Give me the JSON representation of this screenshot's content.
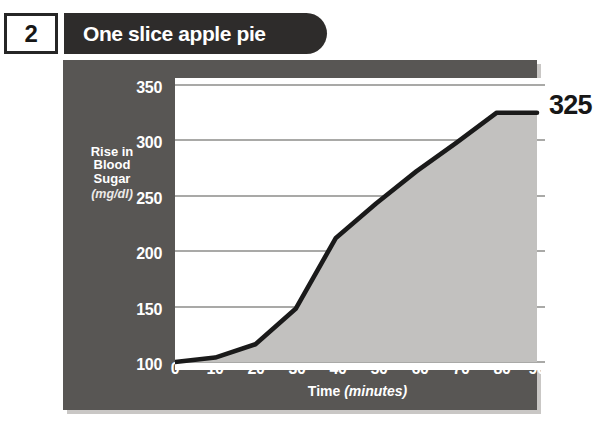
{
  "figure": {
    "number": "2",
    "title": "One slice apple pie",
    "callout_value": "325"
  },
  "chart_data": {
    "type": "area",
    "title": "One slice apple pie",
    "xlabel": "Time",
    "xlabel_unit": "(minutes)",
    "ylabel_lines": [
      "Rise in",
      "Blood",
      "Sugar"
    ],
    "ylabel_unit": "(mg/dl)",
    "x": [
      0,
      10,
      20,
      30,
      40,
      50,
      60,
      70,
      80,
      90
    ],
    "values": [
      100,
      104,
      116,
      148,
      212,
      243,
      272,
      298,
      325,
      325
    ],
    "xticks": [
      "0",
      "10",
      "20",
      "30",
      "40",
      "50",
      "60",
      "70",
      "80",
      "90"
    ],
    "yticks": [
      "100",
      "150",
      "200",
      "250",
      "300",
      "350"
    ],
    "ytick_values": [
      100,
      150,
      200,
      250,
      300,
      350
    ],
    "xlim": [
      0,
      90
    ],
    "ylim": [
      100,
      360
    ],
    "grid": true,
    "legend": "none",
    "annotations": [
      {
        "text": "325",
        "x": 90,
        "y": 325,
        "position": "right-outside"
      }
    ],
    "colors": {
      "panel": "#585654",
      "plot_background": "#ffffff",
      "area_fill": "#c2c1bf",
      "line": "#1a1a1a",
      "gridline": "#8d8c8a",
      "tick_text": "#ffffff",
      "callout_text": "#171717",
      "title_pill": "#2e2c2b",
      "badge_border": "#262626"
    }
  }
}
